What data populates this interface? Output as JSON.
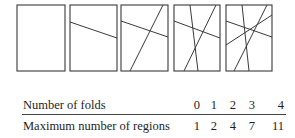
{
  "figure": {
    "stroke_color": "#3a3a3a",
    "panels": [
      {
        "folds": 0,
        "rect": [
          17,
          5,
          65,
          71
        ],
        "lines": []
      },
      {
        "folds": 1,
        "rect": [
          70,
          5,
          117,
          71
        ],
        "lines": [
          [
            70,
            22,
            117,
            38
          ]
        ]
      },
      {
        "folds": 2,
        "rect": [
          121,
          5,
          168,
          71
        ],
        "lines": [
          [
            121,
            21,
            168,
            37
          ],
          [
            163,
            5,
            130,
            71
          ]
        ]
      },
      {
        "folds": 3,
        "rect": [
          174,
          5,
          220,
          71
        ],
        "lines": [
          [
            174,
            21,
            220,
            38
          ],
          [
            216,
            5,
            184,
            71
          ],
          [
            190,
            5,
            198,
            71
          ]
        ]
      },
      {
        "folds": 4,
        "rect": [
          226,
          5,
          272,
          71
        ],
        "lines": [
          [
            226,
            21,
            272,
            37
          ],
          [
            267,
            5,
            234,
            71
          ],
          [
            242,
            5,
            249,
            71
          ],
          [
            226,
            45,
            272,
            15
          ]
        ]
      }
    ]
  },
  "table": {
    "row1_label": "Number of folds",
    "row2_label": "Maximum number of regions",
    "folds": [
      "0",
      "1",
      "2",
      "3",
      "4"
    ],
    "regions": [
      "1",
      "2",
      "4",
      "7",
      "11"
    ]
  }
}
